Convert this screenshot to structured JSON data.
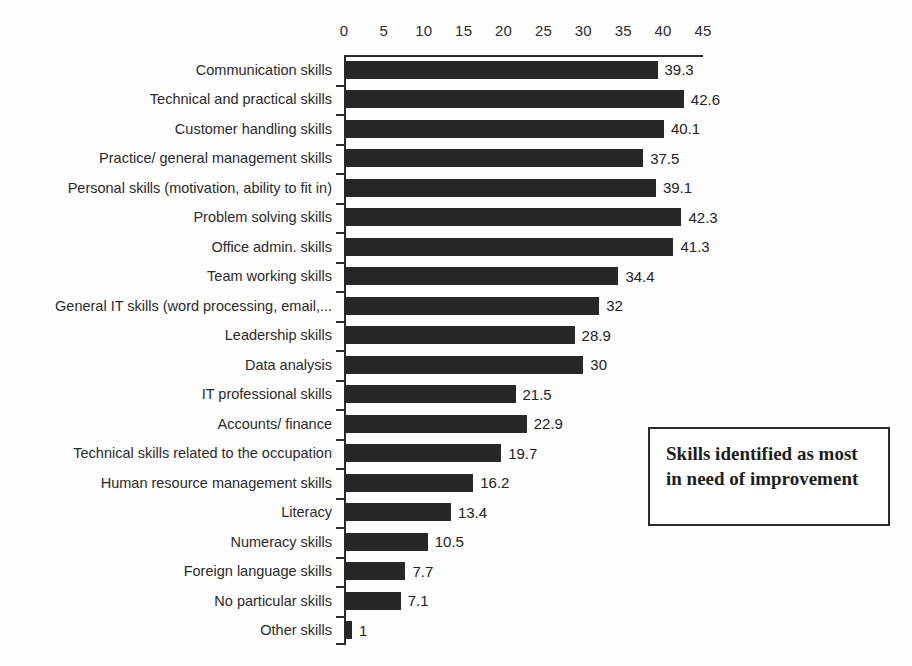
{
  "chart_data": {
    "type": "bar",
    "orientation": "horizontal",
    "title": "",
    "xlabel": "",
    "ylabel": "",
    "xlim": [
      0,
      45
    ],
    "xticks": [
      0,
      5,
      10,
      15,
      20,
      25,
      30,
      35,
      40,
      45
    ],
    "grid": false,
    "legend_position": "inside-right",
    "bar_color": "#272727",
    "axis_color": "#2b2b2b",
    "background_color": "#ffffff",
    "categories": [
      "Communication skills",
      "Technical and practical skills",
      "Customer handling skills",
      "Practice/ general management skills",
      "Personal skills (motivation, ability to fit in)",
      "Problem solving skills",
      "Office admin. skills",
      "Team working skills",
      "General IT skills (word processing, email,...",
      "Leadership skills",
      "Data analysis",
      "IT professional skills",
      "Accounts/ finance",
      "Technical skills related to the occupation",
      "Human resource management skills",
      "Literacy",
      "Numeracy skills",
      "Foreign language skills",
      "No particular skills",
      "Other skills"
    ],
    "values": [
      39.3,
      42.6,
      40.1,
      37.5,
      39.1,
      42.3,
      41.3,
      34.4,
      32,
      28.9,
      30,
      21.5,
      22.9,
      19.7,
      16.2,
      13.4,
      10.5,
      7.7,
      7.1,
      1
    ],
    "value_labels": [
      "39.3",
      "42.6",
      "40.1",
      "37.5",
      "39.1",
      "42.3",
      "41.3",
      "34.4",
      "32",
      "28.9",
      "30",
      "21.5",
      "22.9",
      "19.7",
      "16.2",
      "13.4",
      "10.5",
      "7.7",
      "7.1",
      "1"
    ],
    "annotations": [
      {
        "name": "legend-box",
        "text": "Skills identified as most in need of improvement"
      }
    ]
  },
  "legend": {
    "text": "Skills identified as most in need of improvement"
  }
}
